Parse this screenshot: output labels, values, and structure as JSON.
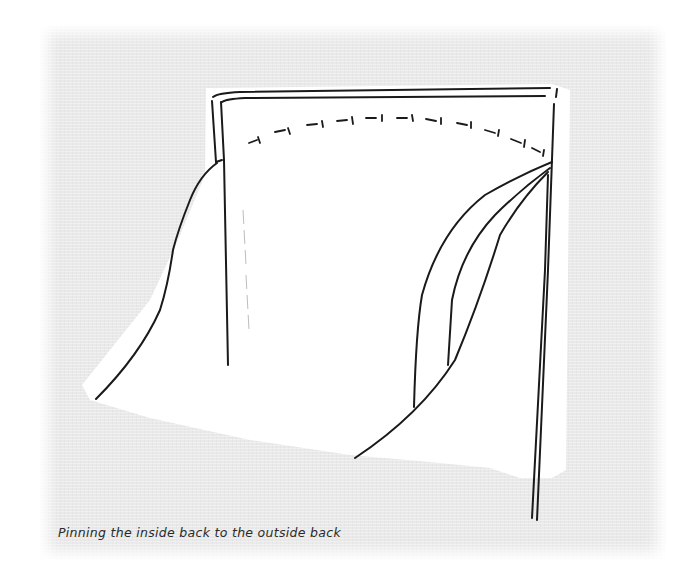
{
  "figure": {
    "caption": "Pinning the inside back to the outside back",
    "colors": {
      "background": "#ffffff",
      "panel": "#e9e9e9",
      "fabric": "#ffffff",
      "ink": "#1a1a1a",
      "caption": "#2a2a2a"
    },
    "elements": {
      "waistband": "double line along top edge",
      "pins": "row of dashed pin marks curving across top",
      "seam_lines": "curved seam lines on the right piece",
      "fold": "faint dashed fold line on left"
    }
  }
}
